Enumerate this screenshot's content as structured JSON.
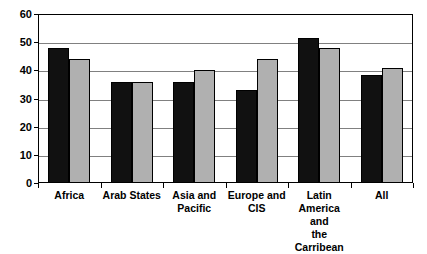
{
  "chart_data": {
    "type": "bar",
    "title": "",
    "xlabel": "",
    "ylabel": "",
    "ylim": [
      0,
      60
    ],
    "yticks": [
      0,
      10,
      20,
      30,
      40,
      50,
      60
    ],
    "grid": true,
    "legend": "none",
    "categories": [
      "Africa",
      "Arab States",
      "Asia and Pacific",
      "Europe and CIS",
      "Latin America and the Carribean",
      "All"
    ],
    "category_labels": [
      [
        "Africa"
      ],
      [
        "Arab States"
      ],
      [
        "Asia and",
        "Pacific"
      ],
      [
        "Europe and",
        "CIS"
      ],
      [
        "Latin",
        "America and",
        "the Carribean"
      ],
      [
        "All"
      ]
    ],
    "series": [
      {
        "name": "series-1",
        "color": "#111111",
        "values": [
          48,
          36,
          36,
          33,
          51.5,
          38.5
        ]
      },
      {
        "name": "series-2",
        "color": "#b0b0b0",
        "values": [
          44,
          36,
          40,
          44,
          48,
          41
        ]
      }
    ]
  }
}
